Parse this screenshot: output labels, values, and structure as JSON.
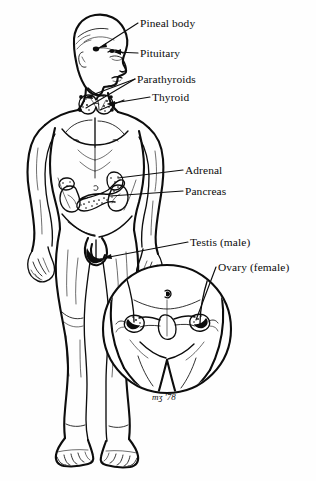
{
  "diagram": {
    "style": "black-and-white line art",
    "background_color": "#fefefe",
    "ink_color": "#0d0d0d"
  },
  "labels": [
    {
      "id": "pineal",
      "text": "Pineal body",
      "x": 140,
      "y": 18,
      "target": "skull-pineal-marker"
    },
    {
      "id": "pituitary",
      "text": "Pituitary",
      "x": 140,
      "y": 48,
      "target": "skull-pituitary-marker"
    },
    {
      "id": "parathyroids",
      "text": "Parathyroids",
      "x": 137,
      "y": 74,
      "target": "neck-parathyroid-dots"
    },
    {
      "id": "thyroid",
      "text": "Thyroid",
      "x": 152,
      "y": 92,
      "target": "neck-thyroid-gland"
    },
    {
      "id": "adrenal",
      "text": "Adrenal",
      "x": 185,
      "y": 165,
      "target": "abdomen-adrenal-glands"
    },
    {
      "id": "pancreas",
      "text": "Pancreas",
      "x": 185,
      "y": 186,
      "target": "abdomen-pancreas"
    },
    {
      "id": "testis",
      "text": "Testis (male)",
      "x": 190,
      "y": 237,
      "target": "groin-testis-marker"
    },
    {
      "id": "ovary",
      "text": "Ovary (female)",
      "x": 218,
      "y": 262,
      "target": "inset-ovaries"
    }
  ],
  "inset": {
    "name": "female-pelvis-detail",
    "shape": "circle",
    "center_x": 167,
    "center_y": 329,
    "radius": 64,
    "contents": "female lower abdomen showing uterus, fallopian tubes and ovaries"
  },
  "signature": {
    "text": "mʒ  '78",
    "x": 152,
    "y": 392
  },
  "organs": [
    {
      "name": "pineal-body",
      "region": "brain"
    },
    {
      "name": "pituitary",
      "region": "brain"
    },
    {
      "name": "parathyroids",
      "region": "neck"
    },
    {
      "name": "thyroid",
      "region": "neck"
    },
    {
      "name": "adrenal",
      "region": "abdomen"
    },
    {
      "name": "pancreas",
      "region": "abdomen"
    },
    {
      "name": "testis",
      "region": "groin"
    },
    {
      "name": "ovary",
      "region": "pelvis-inset"
    }
  ]
}
